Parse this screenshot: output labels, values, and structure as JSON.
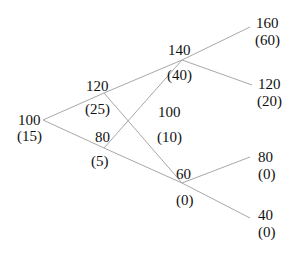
{
  "diagram": {
    "type": "binomial-tree",
    "edge_color": "#a8a8a8",
    "nodes": {
      "n0": {
        "price": "100",
        "value": "(15)"
      },
      "n1u": {
        "price": "120",
        "value": "(25)"
      },
      "n1d": {
        "price": "80",
        "value": "(5)"
      },
      "n2uu": {
        "price": "140",
        "value": "(40)"
      },
      "n2ud": {
        "price": "100",
        "value": "(10)"
      },
      "n2dd": {
        "price": "60",
        "value": "(0)"
      },
      "n3uuu": {
        "price": "160",
        "value": "(60)"
      },
      "n3uud": {
        "price": "120",
        "value": "(20)"
      },
      "n3udd": {
        "price": "80",
        "value": "(0)"
      },
      "n3ddd": {
        "price": "40",
        "value": "(0)"
      }
    }
  }
}
